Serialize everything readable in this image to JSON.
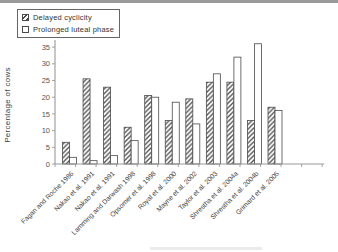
{
  "figure": {
    "background": "#ffffff",
    "top_border_color": "#9a9a9a"
  },
  "legend": {
    "items": [
      {
        "label": "Delayed cyclicity",
        "swatch": "hatched"
      },
      {
        "label": "Prolonged luteal phase",
        "swatch": "white"
      }
    ]
  },
  "colors": {
    "bar_outline": "#4a4a4a",
    "hatch": "#4a4a4a",
    "bar_fill": "#ffffff",
    "axis": "#999999",
    "tick_text": "#555555",
    "xlabel_text": "#444444"
  },
  "chart_data": {
    "type": "bar",
    "title": "",
    "xlabel": "",
    "ylabel": "Percentage of cows",
    "ylim": [
      0,
      35
    ],
    "yticks": [
      0,
      5,
      10,
      15,
      20,
      25,
      30,
      35
    ],
    "grid": false,
    "legend_position": "top-left",
    "extra_unlabeled_ticks": 2,
    "categories": [
      "Fagan and Roche 1986",
      "Nakao et al. 1991",
      "Nakao et al. 1991",
      "Lamming and Darwash 1998",
      "Opsomer et al. 1998",
      "Royal et al. 2000",
      "Mayne et al. 2002",
      "Taylor et al. 2003",
      "Shrestha et al. 2004a",
      "Shrestha et al. 2004b",
      "Grimard et al. 2005"
    ],
    "series": [
      {
        "name": "Delayed cyclicity",
        "style": "hatched",
        "values": [
          6.5,
          25.5,
          23,
          11,
          20.5,
          13,
          19.5,
          24.5,
          24.5,
          13,
          17
        ]
      },
      {
        "name": "Prolonged luteal phase",
        "style": "white",
        "values": [
          2,
          1,
          2.5,
          7,
          20,
          18.5,
          12,
          27,
          32,
          36,
          16
        ]
      }
    ]
  }
}
